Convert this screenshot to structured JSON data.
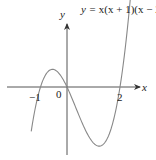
{
  "chart_data": {
    "type": "line",
    "title": "y = x(x + 1)(x − 2)",
    "function": "y = x(x + 1)(x - 2)",
    "xlabel": "x",
    "ylabel": "y",
    "origin_label": "0",
    "x_tick_labels": [
      "−1",
      "2"
    ],
    "roots": [
      -1,
      0,
      2
    ],
    "local_max": {
      "x": -0.55,
      "y": 0.63
    },
    "local_min": {
      "x": 1.22,
      "y": -2.11
    },
    "grid": false,
    "legend": null,
    "series": [
      {
        "name": "y = x(x + 1)(x − 2)",
        "x": [
          -1.35,
          -1.0,
          -0.8,
          -0.55,
          -0.3,
          0.0,
          0.4,
          0.8,
          1.22,
          1.6,
          2.0,
          2.3,
          2.45
        ],
        "y": [
          -1.58,
          0.0,
          0.5,
          0.63,
          0.48,
          0.0,
          -0.9,
          -1.73,
          -2.11,
          -1.66,
          0.0,
          1.99,
          3.43
        ]
      }
    ],
    "colors": {
      "curve": "#888888",
      "axes": "#333333",
      "text": "#222222"
    }
  },
  "labels": {
    "equation_prefix": "y = ",
    "equation_body": "x(x + 1)(x − 2)",
    "x_axis": "x",
    "y_axis": "y",
    "origin": "0",
    "tick_neg1": "−1",
    "tick_2": "2"
  }
}
